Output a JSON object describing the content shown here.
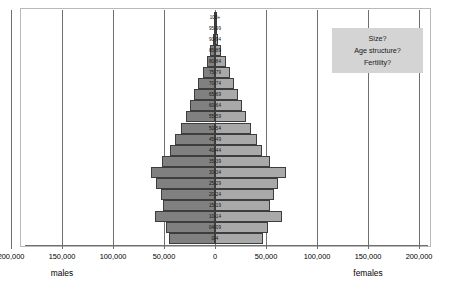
{
  "chart_data": {
    "type": "bar",
    "title": "",
    "subtitle": "",
    "xlabel": "",
    "ylabel": "",
    "orientation": "horizontal",
    "style": "population-pyramid",
    "grid": true,
    "legend_position": "none",
    "xlim": [
      -200000,
      200000
    ],
    "x_tick_values": [
      -200000,
      -150000,
      -100000,
      -50000,
      0,
      50000,
      100000,
      150000,
      200000
    ],
    "x_tick_labels": [
      "200,000",
      "150,000",
      "100,000",
      "50,000",
      "0",
      "50,000",
      "100,000",
      "150,000",
      "200,000"
    ],
    "side_labels": {
      "left": "males",
      "right": "females"
    },
    "categories": [
      "100+",
      "95-99",
      "90-94",
      "85-89",
      "80-84",
      "75-79",
      "70-74",
      "65-69",
      "60-64",
      "55-59",
      "50-54",
      "45-49",
      "40-44",
      "35-39",
      "30-34",
      "25-29",
      "20-24",
      "15-19",
      "10-14",
      "04-09",
      "0-4"
    ],
    "series": [
      {
        "name": "males",
        "color": "#808080",
        "values": [
          200,
          900,
          2200,
          4500,
          8000,
          12000,
          16500,
          20500,
          24500,
          28500,
          33000,
          39000,
          44000,
          52000,
          63000,
          58000,
          52500,
          51000,
          59000,
          48500,
          45000
        ]
      },
      {
        "name": "females",
        "color": "#a9a9a9",
        "values": [
          300,
          1200,
          3000,
          6000,
          10500,
          15000,
          19000,
          22500,
          26000,
          30000,
          35000,
          41000,
          46000,
          54000,
          70000,
          62000,
          58000,
          54000,
          66000,
          52000,
          47000
        ]
      }
    ]
  },
  "annotation": {
    "lines": [
      "Size?",
      "Age structure?",
      "Fertility?"
    ]
  }
}
